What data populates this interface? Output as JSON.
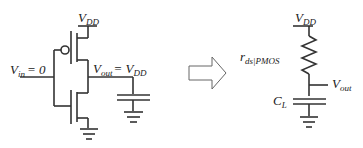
{
  "left_circuit": {
    "vdd_label": "V",
    "vdd_sub": "DD",
    "vin_label": "V",
    "vin_sub": "in",
    "vin_value": "= 0",
    "vout_label": "V",
    "vout_sub": "out",
    "vout_eq": "= V",
    "vout_eq_sub": "DD"
  },
  "arrow": {
    "icon": "hollow-right-arrow"
  },
  "right_circuit": {
    "vdd_label": "V",
    "vdd_sub": "DD",
    "r_label": "r",
    "r_sub": "ds|PMOS",
    "vout_label": "V",
    "vout_sub": "out",
    "c_label": "C",
    "c_sub": "L"
  }
}
